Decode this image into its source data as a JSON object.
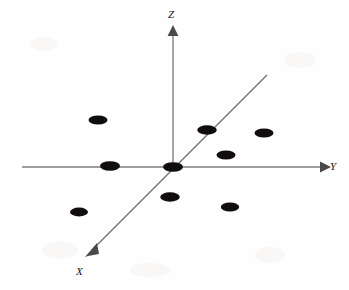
{
  "figure": {
    "background_color": "#fefefe",
    "width": 349,
    "height": 290
  },
  "axes": {
    "z": {
      "label": "Z",
      "label_x": 168,
      "label_y": 18,
      "direction": "up",
      "color": "#7d7d7d",
      "line": {
        "x1": 173,
        "y1": 167,
        "x2": 173,
        "y2": 32
      },
      "arrow": "up-arrowhead"
    },
    "y": {
      "label": "Y",
      "label_x": 330,
      "label_y": 170,
      "direction": "right",
      "color": "#7d7d7d",
      "line": {
        "x1": 22,
        "y1": 167,
        "x2": 320,
        "y2": 167
      },
      "arrow": "right-arrowhead"
    },
    "x": {
      "label": "X",
      "label_x": 76,
      "label_y": 275,
      "direction": "down-left",
      "color": "#6f6f6f",
      "line": {
        "x1": 267,
        "y1": 75,
        "x2": 90,
        "y2": 252
      },
      "arrow": "down-left-arrowhead"
    }
  },
  "chart_data": {
    "type": "scatter",
    "title": "",
    "xlabel": "X",
    "ylabel": "Y",
    "zlabel": "Z",
    "grid": false,
    "legend": null,
    "marker": {
      "shape": "ellipse",
      "color": "#120d0d",
      "radius_x": 9.5,
      "radius_y": 4.6
    },
    "projection": "3d-oblique",
    "point_count": 9,
    "points": [
      {
        "id": "p1",
        "cx": 98,
        "cy": 120,
        "rx": 9.5,
        "ry": 4.6,
        "note": "upper-left quadrant"
      },
      {
        "id": "p2",
        "cx": 110,
        "cy": 166,
        "rx": 10.0,
        "ry": 4.8,
        "note": "on negative Y axis"
      },
      {
        "id": "p3",
        "cx": 79,
        "cy": 212,
        "rx": 9.0,
        "ry": 4.4,
        "note": "lower-left quadrant"
      },
      {
        "id": "p4",
        "cx": 173,
        "cy": 167,
        "rx": 10.0,
        "ry": 4.8,
        "note": "origin"
      },
      {
        "id": "p5",
        "cx": 170,
        "cy": 197,
        "rx": 9.8,
        "ry": 4.7,
        "note": "below origin"
      },
      {
        "id": "p6",
        "cx": 207,
        "cy": 130,
        "rx": 9.8,
        "ry": 4.7,
        "note": "on positive X diagonal"
      },
      {
        "id": "p7",
        "cx": 264,
        "cy": 133,
        "rx": 9.5,
        "ry": 4.6,
        "note": "upper-right quadrant"
      },
      {
        "id": "p8",
        "cx": 226,
        "cy": 155,
        "rx": 9.5,
        "ry": 4.6,
        "note": "mid right"
      },
      {
        "id": "p9",
        "cx": 230,
        "cy": 207,
        "rx": 9.2,
        "ry": 4.5,
        "note": "lower-right quadrant"
      }
    ]
  }
}
